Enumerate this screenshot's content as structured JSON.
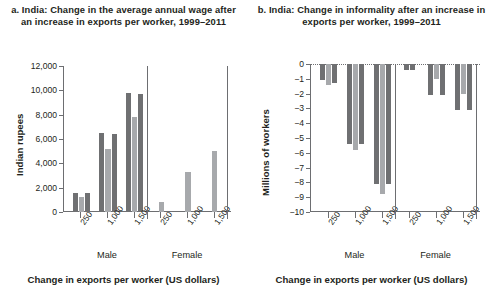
{
  "figure": {
    "background": "#ffffff",
    "colors": {
      "bar_dark": "#6f7072",
      "bar_light": "#a7a9ac",
      "axis": "#6d6e71",
      "text": "#231f20"
    }
  },
  "panels": [
    {
      "key": "a",
      "title": "a. India: Change in the average annual wage after an increase in exports per worker, 1999–2011"
    },
    {
      "key": "b",
      "title": "b. India: Change in informality after an increase in exports per worker, 1999–2011"
    }
  ],
  "chart_data": [
    {
      "type": "bar",
      "panel": "a",
      "title": "a. India: Change in the average annual wage after an increase in exports per worker, 1999–2011",
      "xlabel": "Change in exports per worker (US dollars)",
      "ylabel": "Indian rupees",
      "ylim": [
        0,
        12000
      ],
      "ytick_labels": [
        "0",
        "2,000",
        "4,000",
        "6,000",
        "8,000",
        "10,000",
        "12,000"
      ],
      "yticks": [
        0,
        2000,
        4000,
        6000,
        8000,
        10000,
        12000
      ],
      "grid": false,
      "legend": "none",
      "groups": [
        "Male",
        "Female"
      ],
      "categories": [
        "250",
        "1,000",
        "1,500",
        "250",
        "1,000",
        "1,500"
      ],
      "clusters": [
        {
          "group": "Male",
          "category": "250",
          "values": [
            1600,
            1250,
            1600
          ],
          "shades": [
            "dark",
            "light",
            "dark"
          ]
        },
        {
          "group": "Male",
          "category": "1,000",
          "values": [
            6500,
            5200,
            6450
          ],
          "shades": [
            "dark",
            "light",
            "dark"
          ]
        },
        {
          "group": "Male",
          "category": "1,500",
          "values": [
            9800,
            7800,
            9700
          ],
          "shades": [
            "dark",
            "light",
            "dark"
          ]
        },
        {
          "group": "Female",
          "category": "250",
          "values": [
            800
          ],
          "shades": [
            "light"
          ]
        },
        {
          "group": "Female",
          "category": "1,000",
          "values": [
            3300
          ],
          "shades": [
            "light"
          ]
        },
        {
          "group": "Female",
          "category": "1,500",
          "values": [
            5000
          ],
          "shades": [
            "light"
          ]
        }
      ]
    },
    {
      "type": "bar",
      "panel": "b",
      "title": "b. India: Change in informality after an increase in exports per worker, 1999–2011",
      "xlabel": "Change in exports per worker (US dollars)",
      "ylabel": "Millions of workers",
      "ylim": [
        -10,
        0
      ],
      "ytick_labels": [
        "0",
        "−1",
        "−2",
        "−3",
        "−4",
        "−5",
        "−6",
        "−7",
        "−8",
        "−9",
        "−10"
      ],
      "yticks": [
        0,
        -1,
        -2,
        -3,
        -4,
        -5,
        -6,
        -7,
        -8,
        -9,
        -10
      ],
      "grid": false,
      "legend": "none",
      "groups": [
        "Male",
        "Female"
      ],
      "categories": [
        "250",
        "1,000",
        "1,500",
        "250",
        "1,000",
        "1,500"
      ],
      "clusters": [
        {
          "group": "Male",
          "category": "250",
          "values": [
            -1.1,
            -1.4,
            -1.3
          ],
          "shades": [
            "dark",
            "light",
            "dark"
          ]
        },
        {
          "group": "Male",
          "category": "1,000",
          "values": [
            -5.4,
            -5.8,
            -5.4
          ],
          "shades": [
            "dark",
            "light",
            "dark"
          ]
        },
        {
          "group": "Male",
          "category": "1,500",
          "values": [
            -8.1,
            -8.8,
            -8.1
          ],
          "shades": [
            "dark",
            "light",
            "dark"
          ]
        },
        {
          "group": "Female",
          "category": "250",
          "values": [
            -0.4,
            -0.4
          ],
          "shades": [
            "dark",
            "dark"
          ]
        },
        {
          "group": "Female",
          "category": "1,000",
          "values": [
            -2.1,
            -1.0,
            -2.1
          ],
          "shades": [
            "dark",
            "light",
            "dark"
          ]
        },
        {
          "group": "Female",
          "category": "1,500",
          "values": [
            -3.1,
            -2.0,
            -3.1
          ],
          "shades": [
            "dark",
            "light",
            "dark"
          ]
        }
      ]
    }
  ]
}
